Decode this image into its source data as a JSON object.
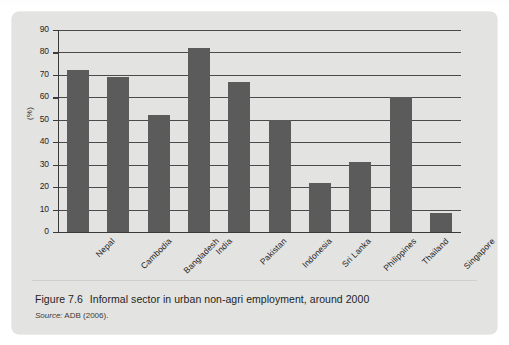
{
  "page": {
    "background_color": "#ffffff",
    "panel_color": "#e3e3e1",
    "top_sliver_ghost_text": "                                                                    "
  },
  "figure": {
    "caption_number": "Figure 7.6",
    "caption_text": "Informal sector in urban non-agri employment, around 2000",
    "source_label": "Source:",
    "source_text": "ADB (2006)."
  },
  "chart_data": {
    "type": "bar",
    "title": "Informal sector in urban non-agri employment, around 2000",
    "xlabel": "",
    "ylabel": "(%)",
    "categories": [
      "Nepal",
      "Cambodia",
      "Bangladesh",
      "India",
      "Pakistan",
      "Indonesia",
      "Sri Lanka",
      "Philippines",
      "Thailand",
      "Singapore"
    ],
    "values": [
      72,
      69,
      52,
      82,
      67,
      50,
      22,
      31,
      60,
      8.5
    ],
    "ylim": [
      0,
      90
    ],
    "yticks": [
      0,
      10,
      20,
      30,
      40,
      50,
      60,
      70,
      80,
      90
    ],
    "ytick_labels": [
      "0",
      "10",
      "20",
      "30",
      "40",
      "50",
      "60",
      "70",
      "80",
      "90"
    ],
    "grid": true,
    "grid_axis": "y",
    "legend": false,
    "legend_position": "none",
    "bar_color": "#5b5b5b",
    "axis_color": "#3b3b3b",
    "series": [
      {
        "name": "Informal sector share",
        "values": [
          72,
          69,
          52,
          82,
          67,
          50,
          22,
          31,
          60,
          8.5
        ]
      }
    ]
  }
}
